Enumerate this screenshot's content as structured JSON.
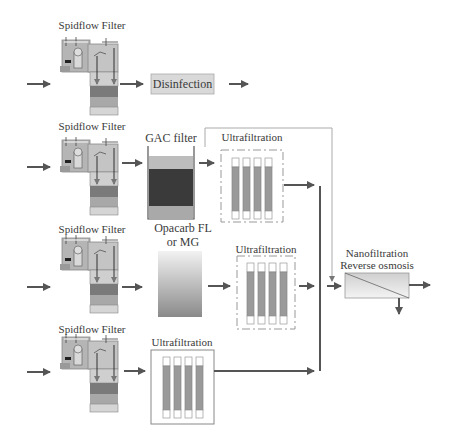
{
  "rows": [
    {
      "id": "row1",
      "filter_label": "Spidflow Filter",
      "next_label": "Disinfection"
    },
    {
      "id": "row2",
      "filter_label": "Spidflow Filter",
      "media_label": "GAC filter",
      "uf_label": "Ultrafiltration"
    },
    {
      "id": "row3",
      "filter_label": "Spidflow Filter",
      "media_label_line1": "Opacarb FL",
      "media_label_line2": "or MG",
      "uf_label": "Ultrafiltration"
    },
    {
      "id": "row4",
      "filter_label": "Spidflow Filter",
      "uf_label": "Ultrafiltration"
    }
  ],
  "final_stage": {
    "line1": "Nanofiltration",
    "line2": "Reverse osmosis"
  },
  "colors": {
    "arrow": "#555555",
    "box_fill": "#d9d9d9",
    "gac_dark": "#3a3a3a",
    "uf_tube": "#9a9a9a",
    "line_gray": "#999999"
  }
}
